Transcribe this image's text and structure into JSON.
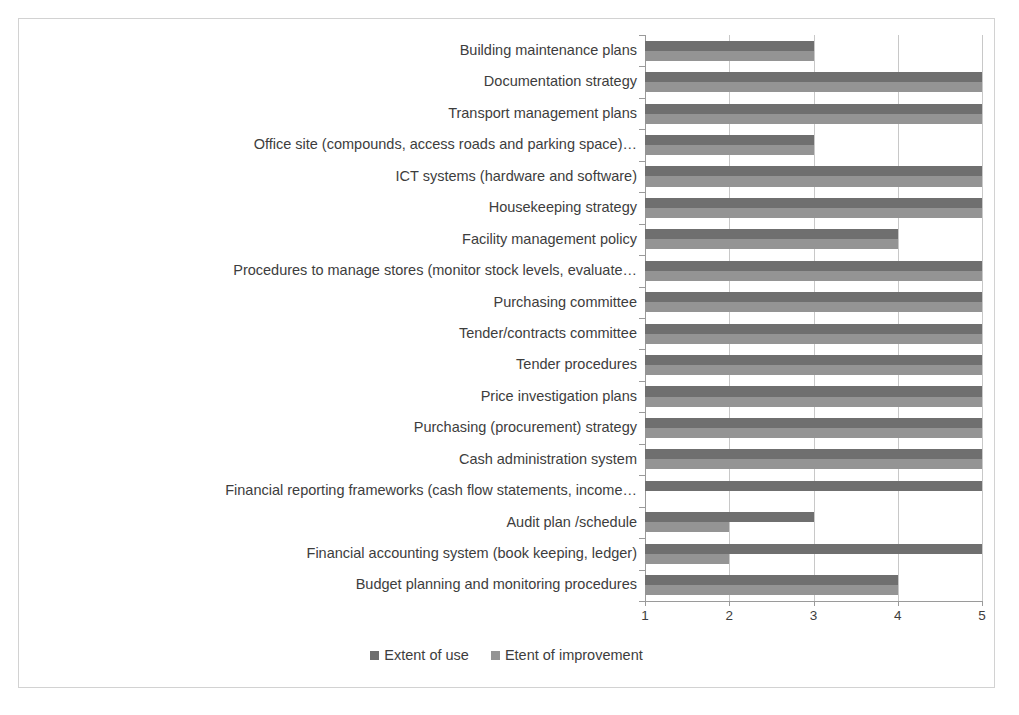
{
  "chart_data": {
    "type": "bar",
    "orientation": "horizontal",
    "title": "",
    "subtitle": "",
    "xlabel": "",
    "ylabel": "",
    "xlim": [
      1,
      5
    ],
    "xticks": [
      "1",
      "2",
      "3",
      "4",
      "5"
    ],
    "grid": true,
    "legend_position": "bottom",
    "categories": [
      "Building maintenance plans",
      "Documentation strategy",
      "Transport management plans",
      "Office site (compounds, access roads and parking space)…",
      "ICT systems (hardware and software)",
      "Housekeeping strategy",
      "Facility management policy",
      "Procedures to manage stores (monitor stock levels, evaluate…",
      "Purchasing committee",
      "Tender/contracts committee",
      "Tender procedures",
      "Price investigation plans",
      "Purchasing (procurement) strategy",
      "Cash administration system",
      "Financial reporting frameworks (cash flow statements, income…",
      "Audit plan /schedule",
      "Financial accounting system (book keeping, ledger)",
      "Budget planning and monitoring procedures"
    ],
    "series": [
      {
        "name": "Extent of use",
        "color": "#6f6f6f",
        "values": [
          3,
          5,
          5,
          3,
          5,
          5,
          4,
          5,
          5,
          5,
          5,
          5,
          5,
          5,
          5,
          3,
          5,
          4
        ]
      },
      {
        "name": "Etent of improvement",
        "color": "#949494",
        "values": [
          3,
          5,
          5,
          3,
          5,
          5,
          4,
          5,
          5,
          5,
          5,
          5,
          5,
          5,
          1,
          2,
          2,
          4
        ]
      }
    ]
  },
  "legend": {
    "items": [
      {
        "label": "Extent of use",
        "color": "#6f6f6f"
      },
      {
        "label": "Etent of improvement",
        "color": "#949494"
      }
    ]
  },
  "colors": {
    "series_use": "#6f6f6f",
    "series_improvement": "#949494",
    "gridline": "#c8c8c8",
    "axis": "#9a9a9a",
    "frame_border": "#d2d2d2",
    "text": "#3d3d3d",
    "background": "#ffffff"
  }
}
